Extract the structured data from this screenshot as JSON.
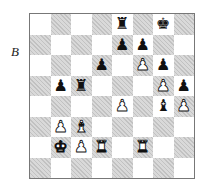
{
  "diagram_label": "B",
  "board": {
    "orientation": "white-bottom",
    "files": [
      "a",
      "b",
      "c",
      "d",
      "e",
      "f",
      "g",
      "h"
    ],
    "ranks": [
      8,
      7,
      6,
      5,
      4,
      3,
      2,
      1
    ],
    "light_color": "#ffffff",
    "dark_color": "#d9d9d9",
    "squares": [
      [
        null,
        null,
        null,
        null,
        {
          "piece": "rook",
          "color": "black",
          "glyph": "♜"
        },
        null,
        {
          "piece": "king",
          "color": "black",
          "glyph": "♚"
        },
        null
      ],
      [
        null,
        null,
        null,
        null,
        {
          "piece": "pawn",
          "color": "black",
          "glyph": "♟"
        },
        {
          "piece": "pawn",
          "color": "black",
          "glyph": "♟"
        },
        null,
        null
      ],
      [
        null,
        null,
        null,
        {
          "piece": "pawn",
          "color": "black",
          "glyph": "♟"
        },
        null,
        {
          "piece": "pawn",
          "color": "white",
          "glyph": "♟"
        },
        {
          "piece": "pawn",
          "color": "black",
          "glyph": "♟"
        },
        null
      ],
      [
        null,
        {
          "piece": "pawn",
          "color": "black",
          "glyph": "♟"
        },
        {
          "piece": "rook",
          "color": "black",
          "glyph": "♜"
        },
        null,
        null,
        null,
        {
          "piece": "pawn",
          "color": "white",
          "glyph": "♟"
        },
        {
          "piece": "pawn",
          "color": "black",
          "glyph": "♟"
        }
      ],
      [
        null,
        null,
        null,
        null,
        {
          "piece": "pawn",
          "color": "white",
          "glyph": "♟"
        },
        null,
        {
          "piece": "bishop",
          "color": "black",
          "glyph": "♝"
        },
        {
          "piece": "pawn",
          "color": "white",
          "glyph": "♟"
        }
      ],
      [
        null,
        {
          "piece": "pawn",
          "color": "white",
          "glyph": "♟"
        },
        {
          "piece": "bishop",
          "color": "white",
          "glyph": "♝"
        },
        null,
        null,
        null,
        null,
        null
      ],
      [
        null,
        {
          "piece": "king",
          "color": "white",
          "glyph": "♚"
        },
        {
          "piece": "pawn",
          "color": "white",
          "glyph": "♟"
        },
        {
          "piece": "rook",
          "color": "white",
          "glyph": "♜"
        },
        null,
        {
          "piece": "rook",
          "color": "white",
          "glyph": "♜"
        },
        null,
        null
      ],
      [
        null,
        null,
        null,
        null,
        null,
        null,
        null,
        null
      ]
    ]
  }
}
